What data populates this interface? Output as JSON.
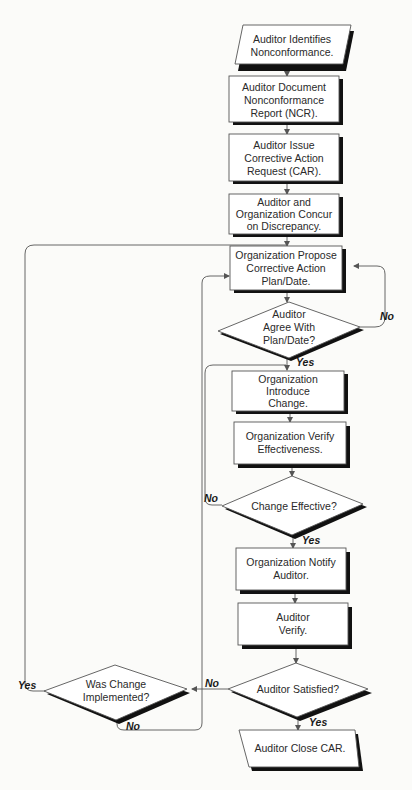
{
  "diagram": {
    "type": "flowchart",
    "nodes": [
      {
        "id": "n1",
        "shape": "parallelogram",
        "lines": [
          "Auditor Identifies",
          "Nonconformance."
        ]
      },
      {
        "id": "n2",
        "shape": "rect",
        "lines": [
          "Auditor Document",
          "Nonconformance",
          "Report (NCR)."
        ]
      },
      {
        "id": "n3",
        "shape": "rect",
        "lines": [
          "Auditor Issue",
          "Corrective Action",
          "Request (CAR)."
        ]
      },
      {
        "id": "n4",
        "shape": "rect",
        "lines": [
          "Auditor and",
          "Organization Concur",
          "on Discrepancy."
        ]
      },
      {
        "id": "n5",
        "shape": "rect",
        "lines": [
          "Organization Propose",
          "Corrective Action",
          "Plan/Date."
        ]
      },
      {
        "id": "d1",
        "shape": "diamond",
        "lines": [
          "Auditor",
          "Agree With",
          "Plan/Date?"
        ]
      },
      {
        "id": "n6",
        "shape": "rect",
        "lines": [
          "Organization",
          "Introduce",
          "Change."
        ]
      },
      {
        "id": "n7",
        "shape": "rect",
        "lines": [
          "Organization Verify",
          "Effectiveness."
        ]
      },
      {
        "id": "d2",
        "shape": "diamond",
        "lines": [
          "Change Effective?"
        ]
      },
      {
        "id": "n8",
        "shape": "rect",
        "lines": [
          "Organization Notify",
          "Auditor."
        ]
      },
      {
        "id": "n9",
        "shape": "rect",
        "lines": [
          "Auditor",
          "Verify."
        ]
      },
      {
        "id": "d3",
        "shape": "diamond",
        "lines": [
          "Auditor Satisfied?"
        ]
      },
      {
        "id": "d4",
        "shape": "diamond",
        "lines": [
          "Was Change",
          "Implemented?"
        ]
      },
      {
        "id": "n10",
        "shape": "parallelogram",
        "lines": [
          "Auditor Close CAR."
        ]
      }
    ],
    "edges": [
      {
        "from": "n1",
        "to": "n2",
        "label": ""
      },
      {
        "from": "n2",
        "to": "n3",
        "label": ""
      },
      {
        "from": "n3",
        "to": "n4",
        "label": ""
      },
      {
        "from": "n4",
        "to": "n5",
        "label": ""
      },
      {
        "from": "n5",
        "to": "d1",
        "label": ""
      },
      {
        "from": "d1",
        "to": "n5",
        "label": "No"
      },
      {
        "from": "d1",
        "to": "n6",
        "label": "Yes"
      },
      {
        "from": "n6",
        "to": "n7",
        "label": ""
      },
      {
        "from": "n7",
        "to": "d2",
        "label": ""
      },
      {
        "from": "d2",
        "to": "n6",
        "label": "No"
      },
      {
        "from": "d2",
        "to": "n8",
        "label": "Yes"
      },
      {
        "from": "n8",
        "to": "n9",
        "label": ""
      },
      {
        "from": "n9",
        "to": "d3",
        "label": ""
      },
      {
        "from": "d3",
        "to": "d4",
        "label": "No"
      },
      {
        "from": "d3",
        "to": "n10",
        "label": "Yes"
      },
      {
        "from": "d4",
        "to": "n5",
        "label": "Yes"
      },
      {
        "from": "d4",
        "to": "n5",
        "label": "No"
      }
    ],
    "labels": {
      "d1_no": "No",
      "d1_yes": "Yes",
      "d2_no": "No",
      "d2_yes": "Yes",
      "d3_no": "No",
      "d3_yes": "Yes",
      "d4_yes": "Yes",
      "d4_no": "No"
    }
  }
}
